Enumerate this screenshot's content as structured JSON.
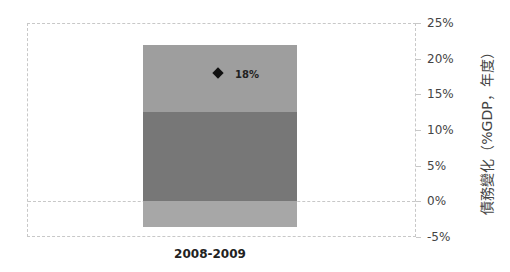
{
  "chart_data": {
    "type": "bar",
    "subtype": "stacked",
    "categories": [
      "2008-2009"
    ],
    "series": [
      {
        "name": "segment-negative",
        "values": [
          -3.6
        ],
        "color": "#a7a7a7"
      },
      {
        "name": "segment-lower",
        "values": [
          12.5
        ],
        "color": "#777777"
      },
      {
        "name": "segment-upper",
        "values": [
          9.4
        ],
        "color": "#9e9e9e"
      }
    ],
    "marker": {
      "category": "2008-2009",
      "value": 18,
      "label": "18%",
      "shape": "diamond",
      "color": "#111111"
    },
    "title": "",
    "xlabel": "",
    "ylabel": "債務變化（%GDP，年度）",
    "ylim": [
      -5,
      25
    ],
    "yticks": [
      "25%",
      "20%",
      "15%",
      "10%",
      "5%",
      "0%",
      "-5%"
    ],
    "ytick_values": [
      25,
      20,
      15,
      10,
      5,
      0,
      -5
    ],
    "y_axis_position": "right",
    "grid": false,
    "legend": null
  }
}
